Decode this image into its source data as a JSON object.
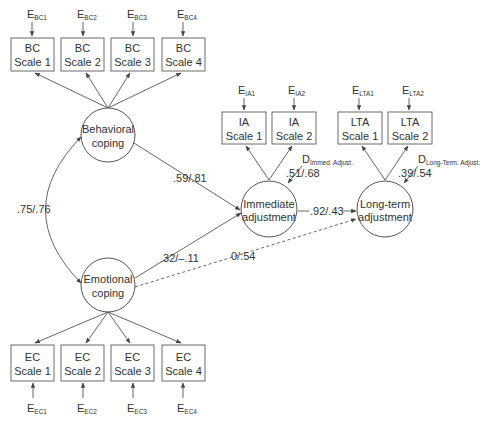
{
  "diagram": {
    "type": "structural-equation-model",
    "behavioral_indicators": [
      {
        "line1": "BC",
        "line2": "Scale 1",
        "error": "E",
        "error_sub": "BC1"
      },
      {
        "line1": "BC",
        "line2": "Scale 2",
        "error": "E",
        "error_sub": "BC2"
      },
      {
        "line1": "BC",
        "line2": "Scale 3",
        "error": "E",
        "error_sub": "BC3"
      },
      {
        "line1": "BC",
        "line2": "Scale 4",
        "error": "E",
        "error_sub": "BC4"
      }
    ],
    "emotional_indicators": [
      {
        "line1": "EC",
        "line2": "Scale 1",
        "error": "E",
        "error_sub": "EC1"
      },
      {
        "line1": "EC",
        "line2": "Scale 2",
        "error": "E",
        "error_sub": "EC2"
      },
      {
        "line1": "EC",
        "line2": "Scale 3",
        "error": "E",
        "error_sub": "EC3"
      },
      {
        "line1": "EC",
        "line2": "Scale 4",
        "error": "E",
        "error_sub": "EC4"
      }
    ],
    "ia_indicators": [
      {
        "line1": "IA",
        "line2": "Scale 1",
        "error": "E",
        "error_sub": "IA1"
      },
      {
        "line1": "IA",
        "line2": "Scale 2",
        "error": "E",
        "error_sub": "IA2"
      }
    ],
    "lta_indicators": [
      {
        "line1": "LTA",
        "line2": "Scale 1",
        "error": "E",
        "error_sub": "LTA1"
      },
      {
        "line1": "LTA",
        "line2": "Scale 2",
        "error": "E",
        "error_sub": "LTA2"
      }
    ],
    "latents": {
      "behavioral": {
        "line1": "Behavioral",
        "line2": "coping"
      },
      "emotional": {
        "line1": "Emotional",
        "line2": "coping"
      },
      "immediate": {
        "line1": "Immediate",
        "line2": "adjustment"
      },
      "longterm": {
        "line1": "Long-term",
        "line2": "adjustment"
      }
    },
    "disturbances": {
      "immediate": {
        "label": "D",
        "sub": "Immed. Adjust.",
        "coef": ".51/.68"
      },
      "longterm": {
        "label": "D",
        "sub": "Long-Term. Adjust.",
        "coef": ".39/.54"
      }
    },
    "paths": {
      "correlation_bc_ec": ".75/.76",
      "bc_to_ia": ".59/.81",
      "ec_to_ia": ".32/–.11",
      "ec_to_lta": "0/.54",
      "ia_to_lta": ".92/.43"
    }
  }
}
